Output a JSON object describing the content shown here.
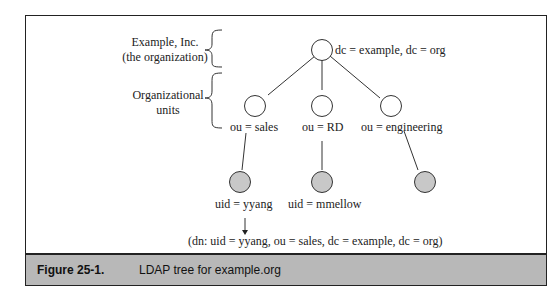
{
  "annotations": {
    "org_line1": "Example, Inc.",
    "org_line2": "(the organization)",
    "ou_line1": "Organizational",
    "ou_line2": "units"
  },
  "nodes": {
    "root": "dc = example, dc = org",
    "sales": "ou = sales",
    "rd": "ou = RD",
    "engineering": "ou = engineering",
    "yyang": "uid = yyang",
    "mmellow": "uid = mmellow"
  },
  "dn": "(dn: uid = yyang, ou = sales, dc = example, dc = org)",
  "caption": {
    "number": "Figure 25-1.",
    "text": "LDAP tree for example.org"
  },
  "colors": {
    "leaf_fill": "#c8c8c8",
    "caption_bg": "#b8b8b8"
  }
}
